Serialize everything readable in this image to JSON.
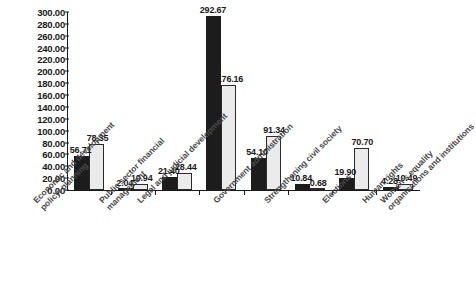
{
  "chart_data": {
    "type": "bar",
    "title": "",
    "subtitle": "",
    "xlabel": "",
    "ylabel": "",
    "ylim": [
      0,
      300
    ],
    "ytick_step": 20,
    "grid": false,
    "legend": null,
    "legend_position": "none",
    "value_label_format": "2 decimals",
    "categories": [
      "Economic and development policy/ planning",
      "Public sector financial management",
      "Legal and judicial development",
      "Government administration",
      "Strengthening civil society",
      "Elections",
      "Human rights",
      "Women's equality organisations and institutions"
    ],
    "category_lines": [
      [
        "Economic and development",
        "policy/ planning"
      ],
      [
        "Public sector financial",
        "management"
      ],
      [
        "Legal and judicial development",
        ""
      ],
      [
        "Government administration",
        ""
      ],
      [
        "Strengthening civil society",
        ""
      ],
      [
        "Elections",
        ""
      ],
      [
        "Human rights",
        ""
      ],
      [
        "Women's equality",
        "organisations and institutions"
      ]
    ],
    "series": [
      {
        "name": "series-1",
        "color": "#1c1c1c",
        "values": [
          56.71,
          2.04,
          21.4,
          292.67,
          54.1,
          10.84,
          19.9,
          4.28
        ]
      },
      {
        "name": "series-2",
        "color": "#ebebeb",
        "values": [
          78.35,
          10.94,
          28.44,
          176.16,
          91.34,
          0.68,
          70.7,
          10.49
        ]
      }
    ],
    "ytick_labels": [
      "0.00",
      "20.00",
      "40.00",
      "60.00",
      "80.00",
      "100.00",
      "120.00",
      "140.00",
      "160.00",
      "180.00",
      "200.00",
      "220.00",
      "240.00",
      "260.00",
      "280.00",
      "300.00"
    ],
    "ytick_values": [
      0,
      20,
      40,
      60,
      80,
      100,
      120,
      140,
      160,
      180,
      200,
      220,
      240,
      260,
      280,
      300
    ]
  }
}
